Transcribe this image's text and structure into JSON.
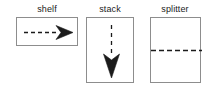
{
  "figure": {
    "title": "",
    "background_color": "#ffffff",
    "stroke_color": "#1b1b1b",
    "box_border_color": "#8d8d8d",
    "panel_count": 3
  },
  "panels": [
    {
      "id": "shelf",
      "label": "shelf",
      "box": {
        "x": 16,
        "y": 17,
        "width": 62,
        "height": 29
      },
      "arrow": {
        "direction": "right",
        "style": "dashed-line-with-barbed-arrowhead",
        "line_dash": "4 3",
        "line_width": 1.3,
        "start": {
          "x": 7,
          "y": 14
        },
        "end": {
          "x": 40,
          "y": 14
        },
        "head_length": 16,
        "head_half_width": 7,
        "head_notch": 5
      },
      "divider": null
    },
    {
      "id": "stack",
      "label": "stack",
      "box": {
        "x": 86,
        "y": 17,
        "width": 48,
        "height": 66
      },
      "arrow": {
        "direction": "down",
        "style": "dashed-line-with-barbed-arrowhead",
        "line_dash": "4 4",
        "line_width": 1.3,
        "start": {
          "x": 24,
          "y": 7
        },
        "end": {
          "x": 24,
          "y": 36
        },
        "head_length": 22,
        "head_half_width": 8,
        "head_notch": 6
      },
      "divider": null
    },
    {
      "id": "splitter",
      "label": "splitter",
      "box": {
        "x": 150,
        "y": 17,
        "width": 51,
        "height": 66
      },
      "arrow": null,
      "divider": {
        "orientation": "horizontal",
        "style": "dashed",
        "line_dash": "5 3",
        "line_width": 1.3,
        "position_y": 33,
        "x_start": 0,
        "x_end": 51
      }
    }
  ]
}
